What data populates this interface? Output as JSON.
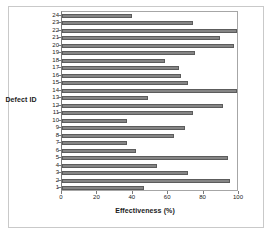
{
  "figure": {
    "background_color": "#ffffff",
    "frame_color": "#c9c9c9",
    "bar_color": "#858585",
    "bar_edge_color": "#5c5c5c",
    "axis_color": "#7a7a7a",
    "gridline_color": "#d2d2d2"
  },
  "chart_data": {
    "type": "bar",
    "orientation": "horizontal",
    "title": "",
    "xlabel": "Effectiveness (%)",
    "ylabel": "Defect ID",
    "categories": [
      "1",
      "2",
      "3",
      "4",
      "5",
      "6",
      "7",
      "8",
      "9",
      "10",
      "11",
      "12",
      "13",
      "14",
      "15",
      "16",
      "17",
      "18",
      "19",
      "20",
      "21",
      "22",
      "23",
      "24"
    ],
    "values": [
      47,
      96,
      72,
      54,
      95,
      42,
      37,
      64,
      70,
      37,
      75,
      92,
      49,
      100,
      72,
      68,
      67,
      59,
      76,
      98,
      90,
      100,
      75,
      40
    ],
    "xlim": [
      0,
      100
    ],
    "xticks": [
      0,
      20,
      40,
      60,
      80,
      100
    ],
    "xtick_labels": [
      "0",
      "20",
      "40",
      "60",
      "80",
      "100"
    ],
    "ytick_labels": [
      "1",
      "2",
      "3",
      "4",
      "5",
      "6",
      "7",
      "8",
      "9",
      "10",
      "11",
      "12",
      "13",
      "14",
      "15",
      "16",
      "17",
      "18",
      "19",
      "20",
      "21",
      "22",
      "23",
      "24"
    ],
    "grid": false,
    "legend": false,
    "category_order": "ascending-bottom-to-top"
  }
}
